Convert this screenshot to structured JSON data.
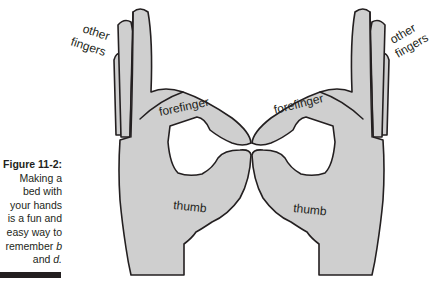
{
  "figure": {
    "label": "Figure 11-2:",
    "caption_lines": [
      "Making a",
      "bed with",
      "your hands",
      "is a fun and",
      "easy way to"
    ],
    "caption_remember": "remember ",
    "caption_b": "b",
    "caption_and": "and ",
    "caption_d": "d."
  },
  "illustration": {
    "left_hand": {
      "other_fingers_label": "other fingers",
      "other_fingers_line1": "other",
      "other_fingers_line2": "fingers",
      "forefinger_label": "forefinger",
      "thumb_label": "thumb"
    },
    "right_hand": {
      "other_fingers_label": "other fingers",
      "other_fingers_line1": "other",
      "other_fingers_line2": "fingers",
      "forefinger_label": "forefinger",
      "thumb_label": "thumb"
    },
    "colors": {
      "hand_fill": "#cfcfcf",
      "outline": "#231f20",
      "background": "#ffffff"
    }
  }
}
